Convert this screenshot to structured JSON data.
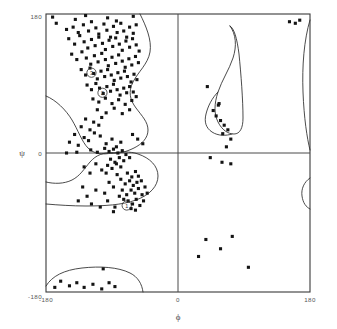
{
  "figure": {
    "type": "ramachandran-scatter",
    "background_color": "#ffffff",
    "frame_color": "#3a3a3a",
    "point_color": "#141414",
    "contour_color": "#2b2b2b"
  },
  "chart_data": {
    "type": "scatter",
    "title": "",
    "subtitle": "",
    "xlabel": "ϕ",
    "ylabel": "ψ",
    "xlim": [
      -180,
      180
    ],
    "ylim": [
      -180,
      180
    ],
    "grid": false,
    "legend": null,
    "xticks": [
      -180,
      0,
      180
    ],
    "xticklabels": [
      "-180",
      "0",
      "180"
    ],
    "yticks": [
      -180,
      0,
      180
    ],
    "yticklabels": [
      "-180",
      "0",
      "180"
    ],
    "axis_lines": {
      "x_zero": 0,
      "y_zero": 0
    },
    "marker": {
      "shape": "square",
      "size_px": 3.1
    },
    "annotations": [
      {
        "label": "3",
        "x": -118,
        "y": 104,
        "shape": "circle",
        "radius_px": 4.6
      },
      {
        "label": "2",
        "x": -103,
        "y": 78,
        "shape": "circle",
        "radius_px": 4.6
      },
      {
        "label": "1",
        "x": -70,
        "y": -68,
        "shape": "circle",
        "radius_px": 4.6
      }
    ],
    "series": [
      {
        "name": "residues",
        "n_points": 196,
        "points": [
          [
            -171,
            176
          ],
          [
            -166,
            168
          ],
          [
            -140,
            173
          ],
          [
            -126,
            178
          ],
          [
            -96,
            175
          ],
          [
            -84,
            171
          ],
          [
            -61,
            177
          ],
          [
            -152,
            160
          ],
          [
            -143,
            163
          ],
          [
            -136,
            156
          ],
          [
            -129,
            166
          ],
          [
            -122,
            158
          ],
          [
            -118,
            170
          ],
          [
            -112,
            162
          ],
          [
            -108,
            154
          ],
          [
            -101,
            167
          ],
          [
            -97,
            159
          ],
          [
            -92,
            150
          ],
          [
            -88,
            164
          ],
          [
            -83,
            156
          ],
          [
            -78,
            168
          ],
          [
            -74,
            158
          ],
          [
            -70,
            150
          ],
          [
            -66,
            163
          ],
          [
            -61,
            155
          ],
          [
            -57,
            166
          ],
          [
            -149,
            148
          ],
          [
            -141,
            141
          ],
          [
            -134,
            152
          ],
          [
            -128,
            144
          ],
          [
            -123,
            136
          ],
          [
            -118,
            147
          ],
          [
            -113,
            139
          ],
          [
            -108,
            150
          ],
          [
            -103,
            142
          ],
          [
            -99,
            134
          ],
          [
            -94,
            146
          ],
          [
            -89,
            138
          ],
          [
            -85,
            149
          ],
          [
            -80,
            141
          ],
          [
            -76,
            133
          ],
          [
            -71,
            145
          ],
          [
            -66,
            137
          ],
          [
            -62,
            148
          ],
          [
            -57,
            140
          ],
          [
            -53,
            132
          ],
          [
            -145,
            128
          ],
          [
            -138,
            121
          ],
          [
            -131,
            131
          ],
          [
            -125,
            123
          ],
          [
            -119,
            115
          ],
          [
            -114,
            126
          ],
          [
            -109,
            118
          ],
          [
            -104,
            129
          ],
          [
            -99,
            121
          ],
          [
            -95,
            113
          ],
          [
            -90,
            124
          ],
          [
            -85,
            116
          ],
          [
            -81,
            127
          ],
          [
            -76,
            119
          ],
          [
            -72,
            111
          ],
          [
            -67,
            122
          ],
          [
            -63,
            114
          ],
          [
            -58,
            125
          ],
          [
            -54,
            117
          ],
          [
            -132,
            108
          ],
          [
            -126,
            101
          ],
          [
            -120,
            110
          ],
          [
            -115,
            103
          ],
          [
            -110,
            96
          ],
          [
            -105,
            106
          ],
          [
            -100,
            99
          ],
          [
            -96,
            108
          ],
          [
            -91,
            101
          ],
          [
            -87,
            94
          ],
          [
            -82,
            104
          ],
          [
            -78,
            97
          ],
          [
            -73,
            106
          ],
          [
            -69,
            99
          ],
          [
            -64,
            92
          ],
          [
            -60,
            102
          ],
          [
            -56,
            95
          ],
          [
            -124,
            88
          ],
          [
            -118,
            82
          ],
          [
            -112,
            90
          ],
          [
            -107,
            84
          ],
          [
            -102,
            77
          ],
          [
            -97,
            86
          ],
          [
            -92,
            80
          ],
          [
            -88,
            89
          ],
          [
            -83,
            82
          ],
          [
            -79,
            75
          ],
          [
            -74,
            84
          ],
          [
            -70,
            78
          ],
          [
            -66,
            86
          ],
          [
            -61,
            79
          ],
          [
            -57,
            73
          ],
          [
            -116,
            70
          ],
          [
            -108,
            66
          ],
          [
            -99,
            71
          ],
          [
            -90,
            64
          ],
          [
            -81,
            69
          ],
          [
            -72,
            63
          ],
          [
            -63,
            68
          ],
          [
            -110,
            56
          ],
          [
            -98,
            52
          ],
          [
            -87,
            58
          ],
          [
            -76,
            51
          ],
          [
            -66,
            56
          ],
          [
            -126,
            44
          ],
          [
            -115,
            40
          ],
          [
            -104,
            46
          ],
          [
            -132,
            34
          ],
          [
            -120,
            30
          ],
          [
            -108,
            36
          ],
          [
            -141,
            24
          ],
          [
            -128,
            20
          ],
          [
            -114,
            26
          ],
          [
            -148,
            14
          ],
          [
            -136,
            10
          ],
          [
            -122,
            16
          ],
          [
            -106,
            22
          ],
          [
            -98,
            12
          ],
          [
            -90,
            18
          ],
          [
            -84,
            8
          ],
          [
            -78,
            14
          ],
          [
            -119,
            4
          ],
          [
            -110,
            1
          ],
          [
            -100,
            6
          ],
          [
            -94,
            2
          ],
          [
            -88,
            5
          ],
          [
            -82,
            0
          ],
          [
            -76,
            3
          ],
          [
            -138,
            1
          ],
          [
            -152,
            0
          ],
          [
            -71,
            -2
          ],
          [
            -66,
            -6
          ],
          [
            -92,
            -8
          ],
          [
            -86,
            -12
          ],
          [
            -80,
            -6
          ],
          [
            -74,
            -10
          ],
          [
            -96,
            -16
          ],
          [
            -90,
            -20
          ],
          [
            -84,
            -14
          ],
          [
            -78,
            -18
          ],
          [
            -104,
            -22
          ],
          [
            -98,
            -26
          ],
          [
            -112,
            -14
          ],
          [
            -120,
            -26
          ],
          [
            -128,
            -18
          ],
          [
            -69,
            -26
          ],
          [
            -63,
            -31
          ],
          [
            -58,
            -24
          ],
          [
            -54,
            -30
          ],
          [
            -50,
            -36
          ],
          [
            -66,
            -36
          ],
          [
            -61,
            -42
          ],
          [
            -56,
            -38
          ],
          [
            -72,
            -40
          ],
          [
            -78,
            -34
          ],
          [
            -83,
            -28
          ],
          [
            -64,
            -48
          ],
          [
            -59,
            -52
          ],
          [
            -54,
            -46
          ],
          [
            -49,
            -54
          ],
          [
            -70,
            -54
          ],
          [
            -76,
            -48
          ],
          [
            -45,
            -44
          ],
          [
            -42,
            -52
          ],
          [
            -68,
            -62
          ],
          [
            -62,
            -66
          ],
          [
            -57,
            -60
          ],
          [
            -52,
            -68
          ],
          [
            -47,
            -62
          ],
          [
            -74,
            -60
          ],
          [
            -80,
            -56
          ],
          [
            -88,
            -44
          ],
          [
            -94,
            -38
          ],
          [
            -58,
            -74
          ],
          [
            -64,
            -72
          ],
          [
            -86,
            -70
          ],
          [
            -100,
            -52
          ],
          [
            -112,
            -48
          ],
          [
            -124,
            -56
          ],
          [
            -136,
            -62
          ],
          [
            -118,
            -66
          ],
          [
            -106,
            -70
          ],
          [
            -130,
            -44
          ],
          [
            -96,
            -62
          ],
          [
            -88,
            -76
          ],
          [
            -102,
            -150
          ],
          [
            -94,
            -168
          ],
          [
            -160,
            -166
          ],
          [
            -148,
            -172
          ],
          [
            -138,
            -168
          ],
          [
            -128,
            -174
          ],
          [
            -116,
            -170
          ],
          [
            -104,
            -176
          ],
          [
            -168,
            -174
          ],
          [
            -86,
            -173
          ],
          [
            -55,
            18
          ],
          [
            -48,
            12
          ],
          [
            -62,
            24
          ],
          [
            55,
            62
          ],
          [
            48,
            55
          ],
          [
            52,
            48
          ],
          [
            58,
            42
          ],
          [
            63,
            36
          ],
          [
            68,
            30
          ],
          [
            61,
            25
          ],
          [
            72,
            18
          ],
          [
            66,
            8
          ],
          [
            56,
            64
          ],
          [
            60,
            -12
          ],
          [
            72,
            -14
          ],
          [
            40,
            86
          ],
          [
            44,
            -6
          ],
          [
            38,
            -112
          ],
          [
            28,
            -134
          ],
          [
            58,
            -124
          ],
          [
            74,
            -108
          ],
          [
            96,
            -148
          ],
          [
            152,
            170
          ],
          [
            160,
            168
          ],
          [
            166,
            172
          ]
        ]
      }
    ],
    "contours": [
      {
        "name": "beta-region-outer",
        "description": "large allowed region upper-left quadrant, wavy right boundary descending from top toward psi=0"
      },
      {
        "name": "alpha-region",
        "description": "broad allowed region lower-left quadrant surrounding alpha-helix cluster"
      },
      {
        "name": "bridge-region",
        "description": "narrow neck near phi=-150..-60, psi around 0 connecting beta and alpha regions"
      },
      {
        "name": "left-handed-helix-region",
        "description": "elongated closed loop in upper-right quadrant, phi 20..80, psi 0..130"
      },
      {
        "name": "bottom-left-region",
        "description": "shallow arc near bottom-left corner, phi -180..-80, psi near -180"
      },
      {
        "name": "right-edge-upper",
        "description": "vertical contour clipped by right frame edge, upper half"
      },
      {
        "name": "right-edge-lower",
        "description": "small arc clipped by right frame edge, lower half"
      }
    ]
  }
}
